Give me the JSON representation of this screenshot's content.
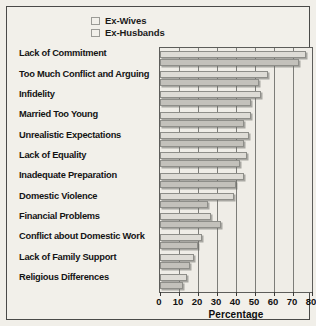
{
  "chart_data": {
    "type": "bar",
    "orientation": "horizontal",
    "title": "",
    "xlabel": "Percentage",
    "ylabel": "",
    "xlim": [
      0,
      80
    ],
    "xticks": [
      0,
      10,
      20,
      30,
      40,
      50,
      60,
      70,
      80
    ],
    "grid": true,
    "legend_position": "top",
    "categories": [
      "Lack of Commitment",
      "Too Much Conflict and Arguing",
      "Infidelity",
      "Married Too Young",
      "Unrealistic Expectations",
      "Lack of Equality",
      "Inadequate Preparation",
      "Domestic Violence",
      "Financial Problems",
      "Conflict about Domestic Work",
      "Lack of Family Support",
      "Religious Differences"
    ],
    "series": [
      {
        "name": "Ex-Wives",
        "color": "#dedcd6",
        "values": [
          77,
          57,
          53,
          48,
          47,
          46,
          44,
          39,
          27,
          22,
          18,
          14
        ]
      },
      {
        "name": "Ex-Husbands",
        "color": "#c3c1bb",
        "values": [
          73,
          52,
          48,
          44,
          44,
          42,
          40,
          25,
          32,
          20,
          16,
          12
        ]
      }
    ]
  },
  "legend": {
    "items": [
      {
        "label": "Ex-Wives"
      },
      {
        "label": "Ex-Husbands"
      }
    ]
  }
}
